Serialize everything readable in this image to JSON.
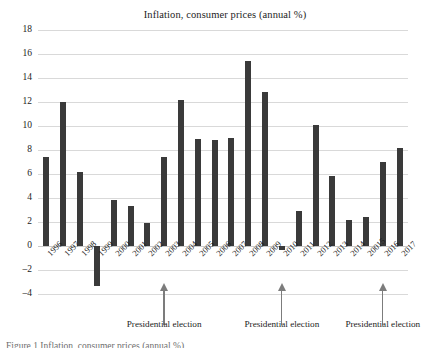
{
  "chart_data": {
    "type": "bar",
    "title": "Inflation, consumer prices (annual %)",
    "xlabel": "",
    "ylabel": "",
    "ylim": [
      -4,
      18
    ],
    "yticks": [
      18,
      16,
      14,
      12,
      10,
      8,
      6,
      4,
      2,
      0,
      "-2",
      "-4"
    ],
    "grid": true,
    "legend": "none",
    "bar_color": "#3a3a3a",
    "categories": [
      "1996",
      "1997",
      "1998",
      "1999",
      "2000",
      "2001",
      "2002",
      "2003",
      "2004",
      "2005",
      "2006",
      "2007",
      "2008",
      "2009",
      "2010",
      "2011",
      "2012",
      "2013",
      "2014",
      "20015",
      "2016",
      "2017"
    ],
    "values": [
      7.4,
      12.0,
      6.2,
      -3.3,
      3.85,
      3.3,
      1.95,
      7.45,
      12.15,
      8.95,
      8.8,
      9.0,
      15.4,
      12.8,
      -0.3,
      2.95,
      10.1,
      5.85,
      2.2,
      2.4,
      7.0,
      8.2
    ],
    "annotations": [
      {
        "label": "Presidential election",
        "at_category": "2003"
      },
      {
        "label": "Presidential election",
        "at_category": "2010"
      },
      {
        "label": "Presidential election",
        "at_category": "2016"
      }
    ]
  },
  "figure": {
    "caption_fragment": "Figure 1 Inflation, consumer prices (annual %)"
  }
}
